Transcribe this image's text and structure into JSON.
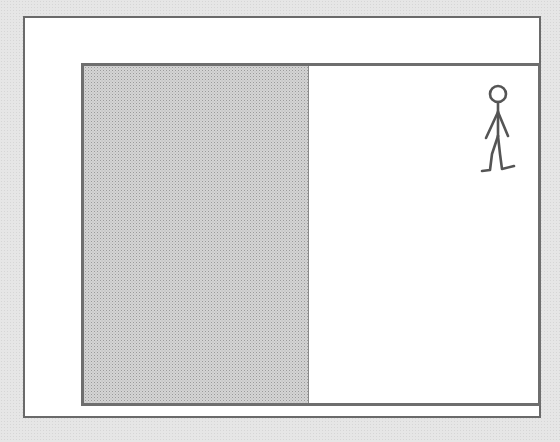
{
  "diagram": {
    "regions": [
      {
        "name": "shaded-region",
        "fill": "#d4d4d4"
      },
      {
        "name": "white-region",
        "fill": "#ffffff"
      }
    ],
    "figure": {
      "type": "stick-figure",
      "position": "top-right"
    },
    "colors": {
      "background": "#e6e6e6",
      "frame_border": "#6e6e6e",
      "figure_stroke": "#555555"
    }
  }
}
